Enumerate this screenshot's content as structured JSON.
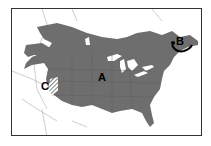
{
  "map": {
    "type": "range-map",
    "region": "North America",
    "colors": {
      "range_fill": "#6e6e6e",
      "background": "#ffffff",
      "borders": "#8a8a8a",
      "frame": "#333333"
    },
    "labels": {
      "a": "A",
      "b": "B",
      "c": "C"
    },
    "areas": [
      {
        "id": "A",
        "description": "main range, solid gray fill"
      },
      {
        "id": "B",
        "description": "northeast area with black arrow/outline (Maritimes)"
      },
      {
        "id": "C",
        "description": "hatched area in western US (California/Nevada)"
      }
    ]
  }
}
